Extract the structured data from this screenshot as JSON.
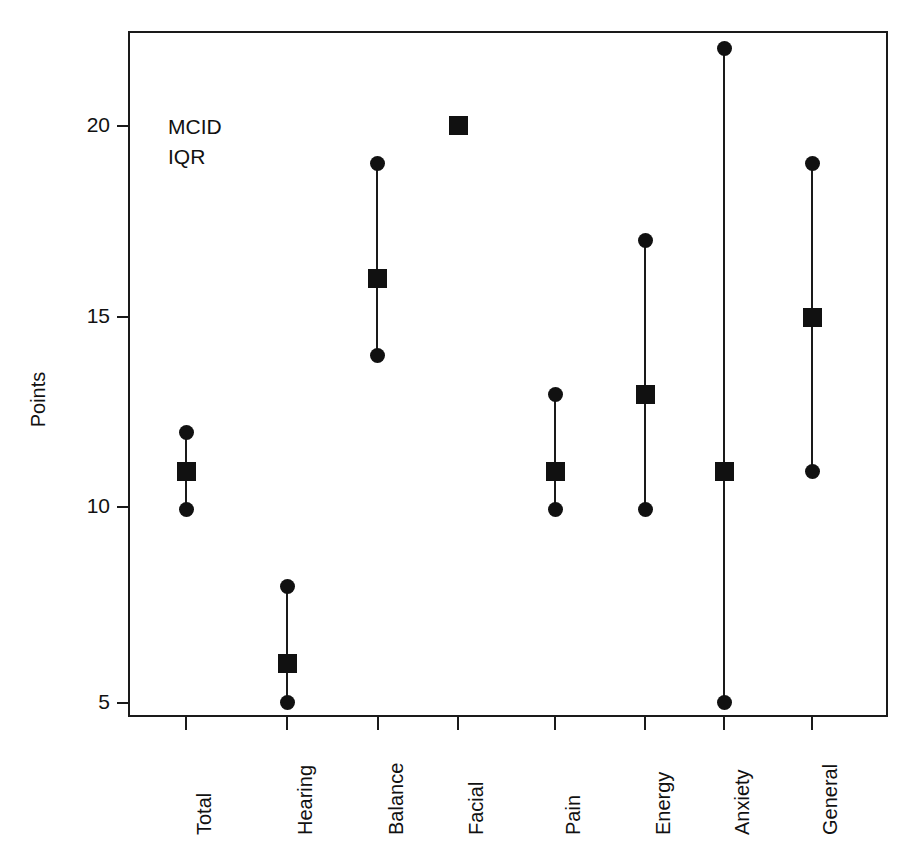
{
  "chart_data": {
    "type": "scatter",
    "title": "",
    "xlabel": "",
    "ylabel": "Points",
    "ylim": [
      3.5,
      23.3
    ],
    "yticks": [
      5,
      10,
      15,
      20
    ],
    "ytick_labels": [
      "5",
      "10",
      "15",
      "20"
    ],
    "grid": false,
    "legend_position": "upper-left-inside",
    "legend_entries": [
      "MCID",
      "IQR"
    ],
    "categories": [
      "Total",
      "Hearing",
      "Balance",
      "Facial",
      "Pain",
      "Energy",
      "Anxiety",
      "General"
    ],
    "series": [
      {
        "name": "MCID",
        "marker": "filled-square",
        "values": [
          11,
          6,
          16,
          20,
          11,
          13,
          11,
          15
        ]
      },
      {
        "name": "IQR lower",
        "marker": "filled-circle",
        "values": [
          10,
          5,
          14,
          null,
          10,
          10,
          5,
          11
        ]
      },
      {
        "name": "IQR upper",
        "marker": "filled-circle",
        "values": [
          12,
          8,
          19,
          null,
          13,
          17,
          22,
          19
        ]
      }
    ],
    "points": [
      {
        "category": "Total",
        "mcid": 11,
        "iqr_low": 10,
        "iqr_high": 12
      },
      {
        "category": "Hearing",
        "mcid": 6,
        "iqr_low": 5,
        "iqr_high": 8
      },
      {
        "category": "Balance",
        "mcid": 16,
        "iqr_low": 14,
        "iqr_high": 19
      },
      {
        "category": "Facial",
        "mcid": 20,
        "iqr_low": null,
        "iqr_high": null
      },
      {
        "category": "Pain",
        "mcid": 11,
        "iqr_low": 10,
        "iqr_high": 13
      },
      {
        "category": "Energy",
        "mcid": 13,
        "iqr_low": 10,
        "iqr_high": 17
      },
      {
        "category": "Anxiety",
        "mcid": 11,
        "iqr_low": 5,
        "iqr_high": 22
      },
      {
        "category": "General",
        "mcid": 15,
        "iqr_low": 11,
        "iqr_high": 19
      }
    ],
    "colors": {
      "marker": "#111111",
      "whisker": "#1a1a1a",
      "frame": "#1a1a1a",
      "background": "#ffffff"
    }
  },
  "axes": {
    "y_title": "Points",
    "y_tick_labels": [
      "20",
      "15",
      "10",
      "5"
    ],
    "x_tick_labels": [
      "Total",
      "Hearing",
      "Balance",
      "Facial",
      "Pain",
      "Energy",
      "Anxiety",
      "General"
    ]
  },
  "legend": {
    "line1": "MCID",
    "line2": "IQR"
  },
  "title": "",
  "caption": ""
}
